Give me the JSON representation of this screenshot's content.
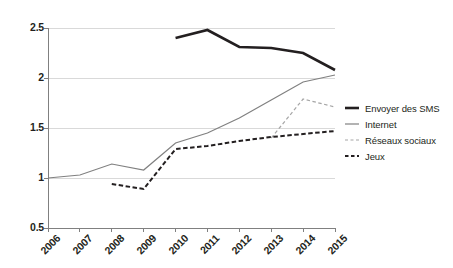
{
  "chart_data": {
    "type": "line",
    "title": "",
    "subtitle": "",
    "xlabel": "",
    "ylabel": "",
    "x": [
      "2006",
      "2007",
      "2008",
      "2009",
      "2010",
      "2011",
      "2012",
      "2013",
      "2014",
      "2015"
    ],
    "categories": [
      "2006",
      "2007",
      "2008",
      "2009",
      "2010",
      "2011",
      "2012",
      "2013",
      "2014",
      "2015"
    ],
    "ylim": [
      0.5,
      2.5
    ],
    "y_ticks": [
      "0.5",
      "1",
      "1.5",
      "2",
      "2.5"
    ],
    "y_tick_values": [
      0.5,
      1,
      1.5,
      2,
      2.5
    ],
    "grid": true,
    "grid_axis": "y",
    "legend_position": "right",
    "series": [
      {
        "name": "Envoyer des SMS",
        "style": "solid",
        "width": 2.6,
        "color": "#231f20",
        "x": [
          "2010",
          "2011",
          "2012",
          "2013",
          "2014",
          "2015"
        ],
        "values": [
          2.4,
          2.48,
          2.31,
          2.3,
          2.25,
          2.08
        ]
      },
      {
        "name": "Internet",
        "style": "solid",
        "width": 1.2,
        "color": "#808080",
        "x": [
          "2006",
          "2007",
          "2008",
          "2009",
          "2010",
          "2011",
          "2012",
          "2013",
          "2014",
          "2015"
        ],
        "values": [
          1.0,
          1.03,
          1.14,
          1.08,
          1.35,
          1.45,
          1.6,
          1.78,
          1.96,
          2.03
        ]
      },
      {
        "name": "Réseaux sociaux",
        "style": "dashed",
        "width": 1.2,
        "color": "#a6a6a6",
        "x": [
          "2013",
          "2014",
          "2015"
        ],
        "values": [
          1.4,
          1.79,
          1.71
        ]
      },
      {
        "name": "Jeux",
        "style": "dashed",
        "width": 2.0,
        "color": "#231f20",
        "x": [
          "2008",
          "2009",
          "2010",
          "2011",
          "2012",
          "2013",
          "2014",
          "2015"
        ],
        "values": [
          0.94,
          0.89,
          1.29,
          1.32,
          1.37,
          1.41,
          1.44,
          1.47
        ]
      }
    ],
    "colors": {
      "axis": "#808080",
      "grid": "#d9d9d9",
      "text": "#231f20",
      "sms": "#231f20",
      "internet": "#808080",
      "reseaux": "#a6a6a6",
      "jeux": "#231f20"
    }
  },
  "legend": {
    "items": [
      {
        "label": "Envoyer des SMS"
      },
      {
        "label": "Internet"
      },
      {
        "label": "Réseaux sociaux"
      },
      {
        "label": "Jeux"
      }
    ]
  }
}
